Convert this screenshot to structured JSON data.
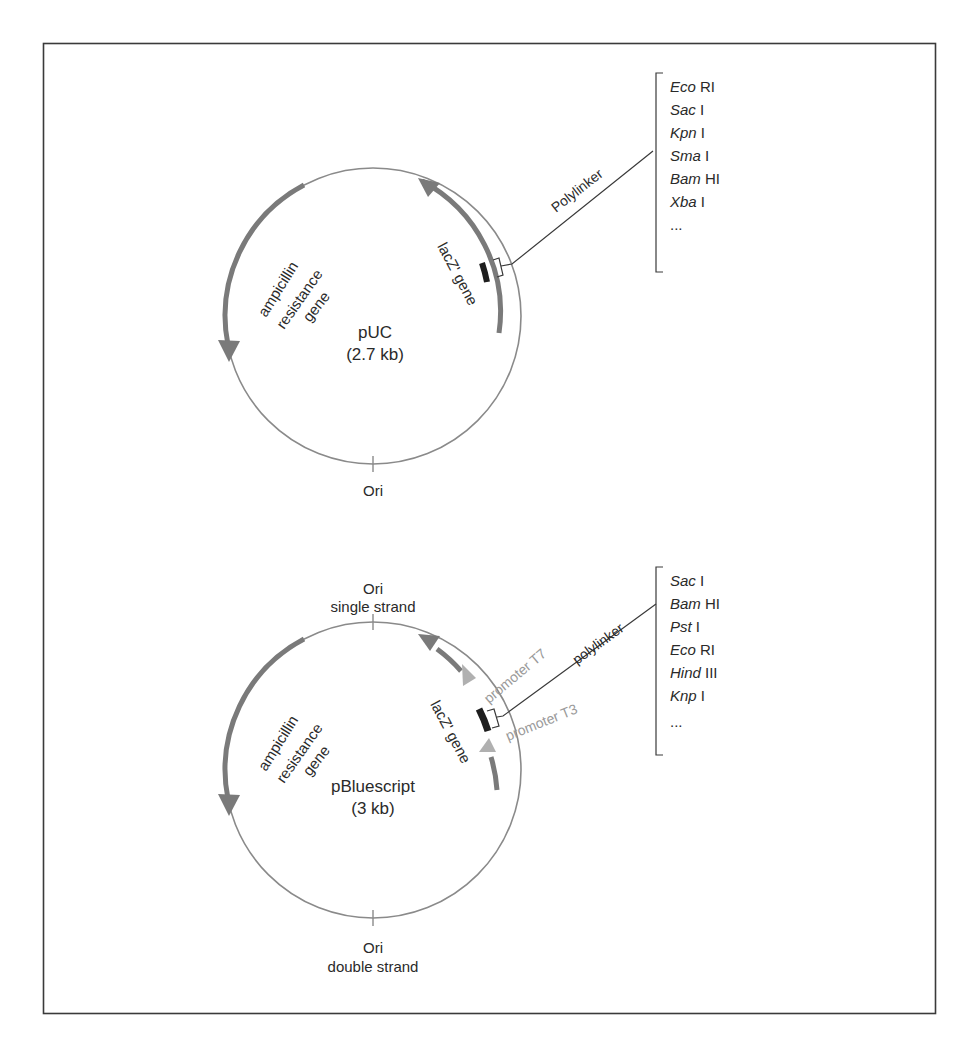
{
  "figure": {
    "plasmids": [
      {
        "name": "pUC",
        "size": "(2.7 kb)",
        "genes": {
          "amp": [
            "ampicillin",
            "resistance",
            "gene"
          ],
          "lacz": "lacZ' gene"
        },
        "ori": [
          "Ori"
        ],
        "polylinker_label": "Polylinker",
        "sites": [
          {
            "italic": "Eco",
            "roman": " RI"
          },
          {
            "italic": "Sac",
            "roman": " I"
          },
          {
            "italic": "Kpn",
            "roman": " I"
          },
          {
            "italic": "Sma",
            "roman": " I"
          },
          {
            "italic": "Bam",
            "roman": " HI"
          },
          {
            "italic": "Xba",
            "roman": " I"
          },
          {
            "italic": "",
            "roman": "..."
          }
        ]
      },
      {
        "name": "pBluescript",
        "size": "(3 kb)",
        "genes": {
          "amp": [
            "ampicillin",
            "resistance",
            "gene"
          ],
          "lacz": "lacZ' gene"
        },
        "ori_ss": [
          "Ori",
          "single strand"
        ],
        "ori": [
          "Ori",
          "double strand"
        ],
        "polylinker_label": "polylinker",
        "promoters": [
          "promoter T7",
          "promoter T3"
        ],
        "sites": [
          {
            "italic": "Sac",
            "roman": " I"
          },
          {
            "italic": "Bam",
            "roman": " HI"
          },
          {
            "italic": "Pst",
            "roman": " I"
          },
          {
            "italic": "Eco",
            "roman": " RI"
          },
          {
            "italic": "Hind",
            "roman": " III"
          },
          {
            "italic": "Knp",
            "roman": " I"
          },
          {
            "italic": "",
            "roman": "..."
          }
        ]
      }
    ],
    "colors": {
      "frame": "#3a3a3a",
      "circle": "#8a8a8a",
      "gene_arrow": "#7a7a7a",
      "polylinker_block": "#1e1e1e",
      "promoter": "#b0b0b0",
      "text": "#2a2a2a"
    }
  }
}
